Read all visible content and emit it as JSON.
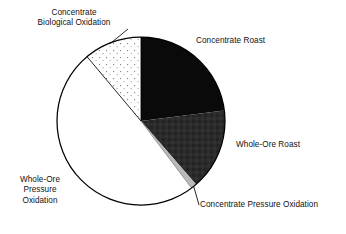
{
  "figure": {
    "type": "pie-chart",
    "background_color": "#ffffff",
    "outline_color": "#000000"
  },
  "labels": {
    "concentrate_biological_oxidation": {
      "line1": "Concentrate",
      "line2": "Biological Oxidation"
    },
    "concentrate_roast": {
      "line1": "Concentrate Roast"
    },
    "whole_ore_roast": {
      "line1": "Whole-Ore Roast"
    },
    "concentrate_pressure_oxidation": {
      "line1": "Concentrate Pressure Oxidation"
    },
    "whole_ore_pressure_oxidation": {
      "line1": "Whole-Ore",
      "line2": "Pressure",
      "line3": "Oxidation"
    }
  },
  "chart_data": {
    "type": "pie",
    "title": "",
    "subtitle": "",
    "xlabel": "",
    "ylabel": "",
    "grid": false,
    "legend_position": "none",
    "labels_placement": "outside-callout",
    "start_angle_deg": 0,
    "direction": "clockwise",
    "center_px": [
      141,
      121
    ],
    "radius_px": 84,
    "slices": [
      {
        "label": "Concentrate Roast",
        "value": 23.0,
        "angle_deg": 82.8,
        "start_angle_deg": 0.0,
        "end_angle_deg": 82.8,
        "fill": "#0a0a0a",
        "fill_style": "solid-black"
      },
      {
        "label": "Whole-Ore Roast",
        "value": 15.6,
        "angle_deg": 56.2,
        "start_angle_deg": 82.8,
        "end_angle_deg": 139.0,
        "fill": "#2b2b2b",
        "fill_style": "solid-dark-gray-textured"
      },
      {
        "label": "Concentrate Pressure Oxidation",
        "value": 1.1,
        "angle_deg": 4.0,
        "start_angle_deg": 139.0,
        "end_angle_deg": 143.0,
        "fill": "#b9b9b9",
        "fill_style": "solid-light-gray"
      },
      {
        "label": "Whole-Ore Pressure Oxidation",
        "value": 49.2,
        "angle_deg": 177.0,
        "start_angle_deg": 143.0,
        "end_angle_deg": 320.0,
        "fill": "#ffffff",
        "fill_style": "solid-white"
      },
      {
        "label": "Concentrate Biological Oxidation",
        "value": 11.1,
        "angle_deg": 40.0,
        "start_angle_deg": 320.0,
        "end_angle_deg": 360.0,
        "fill": "#ffffff",
        "fill_style": "white-with-dot-stipple"
      }
    ],
    "units": "percent"
  }
}
